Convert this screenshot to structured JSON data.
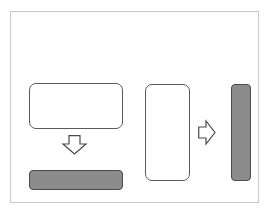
{
  "diagram": {
    "colors": {
      "frame_border": "#c9c9c9",
      "outline_stroke": "#5a5a5a",
      "filled_bar": "#8c8c8c",
      "filled_bar_stroke": "#4a4a4a",
      "arrow_stroke": "#4a4a4a",
      "background": "#ffffff"
    },
    "shapes": [
      {
        "id": "wide-outline-rect",
        "type": "rounded-rect",
        "fill": "white"
      },
      {
        "id": "down-arrow",
        "type": "block-arrow",
        "direction": "down"
      },
      {
        "id": "wide-filled-bar",
        "type": "rounded-rect",
        "fill": "gray"
      },
      {
        "id": "tall-outline-rect",
        "type": "rounded-rect",
        "fill": "white"
      },
      {
        "id": "right-arrow",
        "type": "block-arrow",
        "direction": "right"
      },
      {
        "id": "tall-filled-bar",
        "type": "rounded-rect",
        "fill": "gray"
      }
    ]
  }
}
